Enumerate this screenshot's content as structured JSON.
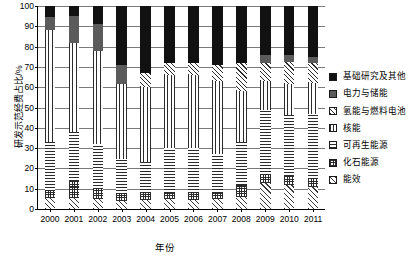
{
  "chart_data": {
    "type": "bar",
    "stacked": true,
    "title": "",
    "xlabel": "年份",
    "ylabel": "研发示范经费占比/%",
    "ylim": [
      0,
      100
    ],
    "ytick_step": 10,
    "yticks": [
      "0",
      "10",
      "20",
      "30",
      "40",
      "50",
      "60",
      "70",
      "80",
      "90",
      "100"
    ],
    "grid": true,
    "legend_position": "right",
    "categories": [
      "2000",
      "2001",
      "2002",
      "2003",
      "2004",
      "2005",
      "2006",
      "2007",
      "2008",
      "2009",
      "2010",
      "2011"
    ],
    "series": [
      {
        "name": "能效",
        "pattern": "check-diag",
        "values": [
          5.5,
          5.5,
          5.0,
          4.0,
          4.5,
          5.0,
          4.5,
          5.0,
          6.0,
          13.0,
          12.0,
          11.0
        ]
      },
      {
        "name": "化石能源",
        "pattern": "checker",
        "values": [
          3.5,
          8.5,
          5.0,
          3.5,
          3.5,
          3.0,
          3.5,
          3.0,
          6.0,
          4.0,
          4.5,
          4.0
        ]
      },
      {
        "name": "可再生能源",
        "pattern": "horizontal-lines",
        "values": [
          24.0,
          24.0,
          22.0,
          17.0,
          15.0,
          22.0,
          22.0,
          19.0,
          21.0,
          32.0,
          30.0,
          32.0
        ]
      },
      {
        "name": "核能",
        "pattern": "vertical-lines",
        "values": [
          55.0,
          44.0,
          46.0,
          37.0,
          37.0,
          36.0,
          36.0,
          36.0,
          25.0,
          14.0,
          15.0,
          15.0
        ]
      },
      {
        "name": "氢能与燃料电池",
        "pattern": "diagonal-hatch",
        "values": [
          0.0,
          0.0,
          0.0,
          0.0,
          7.0,
          6.0,
          6.0,
          8.0,
          14.0,
          9.0,
          11.0,
          10.0
        ]
      },
      {
        "name": "电力与储能",
        "pattern": "dark-gray",
        "values": [
          6.5,
          13.0,
          13.0,
          9.5,
          0.0,
          0.0,
          0.0,
          0.0,
          0.0,
          4.0,
          3.5,
          3.0
        ]
      },
      {
        "name": "基础研究及其他",
        "pattern": "solid-black",
        "values": [
          5.5,
          5.0,
          9.0,
          29.0,
          33.0,
          28.0,
          28.0,
          29.0,
          28.0,
          24.0,
          24.0,
          25.0
        ]
      }
    ],
    "legend": [
      {
        "label": "基础研究及其他",
        "pattern": "solid-black"
      },
      {
        "label": "电力与储能",
        "pattern": "dark-gray"
      },
      {
        "label": "氢能与燃料电池",
        "pattern": "diagonal-hatch"
      },
      {
        "label": "核能",
        "pattern": "vertical-lines"
      },
      {
        "label": "可再生能源",
        "pattern": "horizontal-lines"
      },
      {
        "label": "化石能源",
        "pattern": "checker"
      },
      {
        "label": "能效",
        "pattern": "check-diag"
      }
    ]
  }
}
